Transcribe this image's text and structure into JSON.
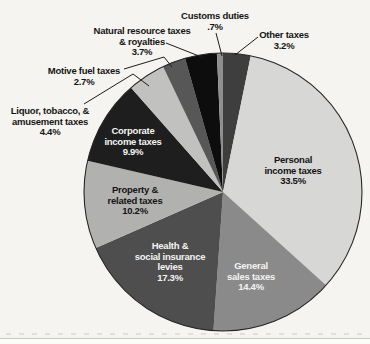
{
  "figure": {
    "description_colors": {
      "page_background": "#f5f4f0",
      "pie_outline": "#262626",
      "leader_line": "#1c1c1c"
    }
  },
  "chart_data": {
    "type": "pie",
    "title": "",
    "start_angle_deg": 0,
    "direction": "clockwise",
    "grid": false,
    "legend": false,
    "units": "%",
    "slices": [
      {
        "name": "other-taxes",
        "label": "Other taxes\n3.2%",
        "value": 3.2,
        "color": "#3e3e3e",
        "label_placement": "outside",
        "label_color": "#151515"
      },
      {
        "name": "personal-income-taxes",
        "label": "Personal\nincome taxes\n33.5%",
        "value": 33.5,
        "color": "#d7d7d5",
        "label_placement": "inside",
        "label_color": "#141414"
      },
      {
        "name": "general-sales-taxes",
        "label": "General\nsales taxes\n14.4%",
        "value": 14.4,
        "color": "#8a8a8a",
        "label_placement": "inside",
        "label_color": "#f4f4f2"
      },
      {
        "name": "health-social-insurance-levies",
        "label": "Health &\nsocial insurance\nlevies\n17.3%",
        "value": 17.3,
        "color": "#4e4e4e",
        "label_placement": "inside",
        "label_color": "#f4f4f2"
      },
      {
        "name": "property-related-taxes",
        "label": "Property &\nrelated taxes\n10.2%",
        "value": 10.2,
        "color": "#b1b1af",
        "label_placement": "inside",
        "label_color": "#141414"
      },
      {
        "name": "corporate-income-taxes",
        "label": "Corporate\nincome taxes\n9.9%",
        "value": 9.9,
        "color": "#1e1e1e",
        "label_placement": "inside",
        "label_color": "#f4f4f2"
      },
      {
        "name": "liquor-tobacco-amusement-taxes",
        "label": "Liquor, tobacco, &\namusement taxes\n4.4%",
        "value": 4.4,
        "color": "#c1c1bf",
        "label_placement": "outside",
        "label_color": "#151515"
      },
      {
        "name": "motive-fuel-taxes",
        "label": "Motive fuel taxes\n2.7%",
        "value": 2.7,
        "color": "#575757",
        "label_placement": "outside",
        "label_color": "#151515"
      },
      {
        "name": "natural-resource-taxes-royalties",
        "label": "Natural resource taxes\n& royalties\n3.7%",
        "value": 3.7,
        "color": "#0d0d0d",
        "label_placement": "outside",
        "label_color": "#151515"
      },
      {
        "name": "customs-duties",
        "label": "Customs duties\n.7%",
        "value": 0.7,
        "color": "#8f8f8f",
        "label_placement": "outside",
        "label_color": "#151515"
      }
    ]
  }
}
